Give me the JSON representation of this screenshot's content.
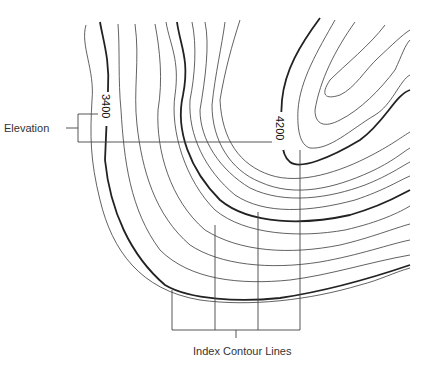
{
  "diagram": {
    "type": "topographic contour map",
    "labels": {
      "elevation": "Elevation",
      "index_contour_lines": "Index Contour Lines"
    },
    "elevation_values": {
      "left": "3400",
      "right": "4200"
    },
    "colors": {
      "background": "#ffffff",
      "line": "#333333",
      "text": "#333333"
    }
  }
}
